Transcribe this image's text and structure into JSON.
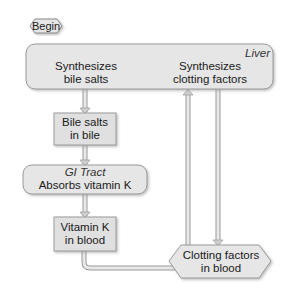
{
  "diagram": {
    "start_node": {
      "label": "Begin"
    },
    "liver": {
      "title": "Liver",
      "left_line1": "Synthesizes",
      "left_line2": "bile salts",
      "right_line1": "Synthesizes",
      "right_line2": "clotting factors"
    },
    "bile_box": {
      "line1": "Bile salts",
      "line2": "in bile"
    },
    "gi_tract": {
      "title": "GI Tract",
      "text": "Absorbs vitamin K"
    },
    "vitk_box": {
      "line1": "Vitamin K",
      "line2": "in blood"
    },
    "end_node": {
      "line1": "Clotting factors",
      "line2": "in blood"
    },
    "edges": [
      {
        "from": "liver",
        "to": "bile_box"
      },
      {
        "from": "bile_box",
        "to": "gi_tract"
      },
      {
        "from": "gi_tract",
        "to": "vitk_box"
      },
      {
        "from": "vitk_box",
        "to": "liver"
      },
      {
        "from": "liver",
        "to": "end_node"
      }
    ],
    "colors": {
      "fill": "#e6e6e6",
      "stroke": "#9a9a9a",
      "arrow": "#bdbdbd"
    }
  }
}
